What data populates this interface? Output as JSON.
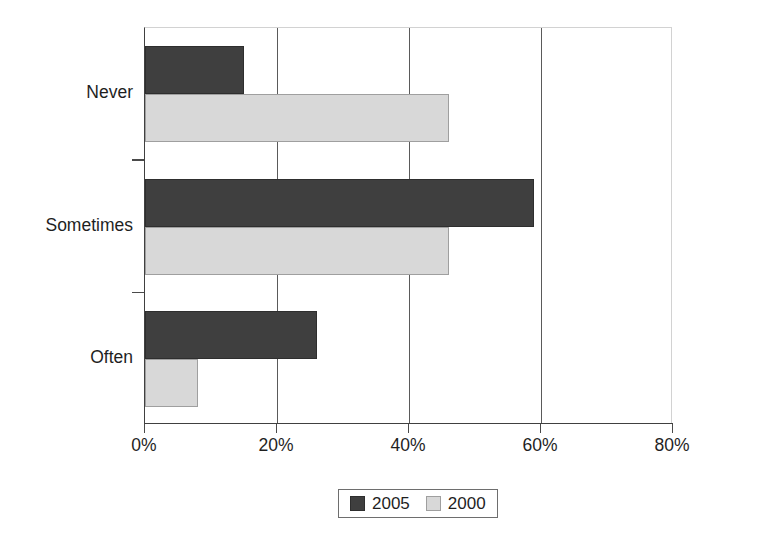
{
  "chart_data": {
    "type": "bar",
    "orientation": "horizontal",
    "title": "",
    "xlabel": "",
    "ylabel": "",
    "categories": [
      "Never",
      "Sometimes",
      "Often"
    ],
    "series": [
      {
        "name": "2005",
        "color": "#3f3f3f",
        "values": [
          15,
          59,
          26
        ]
      },
      {
        "name": "2000",
        "color": "#d8d8d8",
        "values": [
          46,
          46,
          8
        ]
      }
    ],
    "xlim": [
      0,
      80
    ],
    "xticks": [
      0,
      20,
      40,
      60,
      80
    ],
    "xtick_labels": [
      "0%",
      "20%",
      "40%",
      "60%",
      "80%"
    ],
    "grid": "vertical",
    "legend_position": "bottom"
  },
  "legend": {
    "entries": [
      {
        "label": "2005"
      },
      {
        "label": "2000"
      }
    ]
  },
  "axis": {
    "tick_labels": [
      "0%",
      "20%",
      "40%",
      "60%",
      "80%"
    ],
    "category_labels": [
      "Never",
      "Sometimes",
      "Often"
    ]
  }
}
